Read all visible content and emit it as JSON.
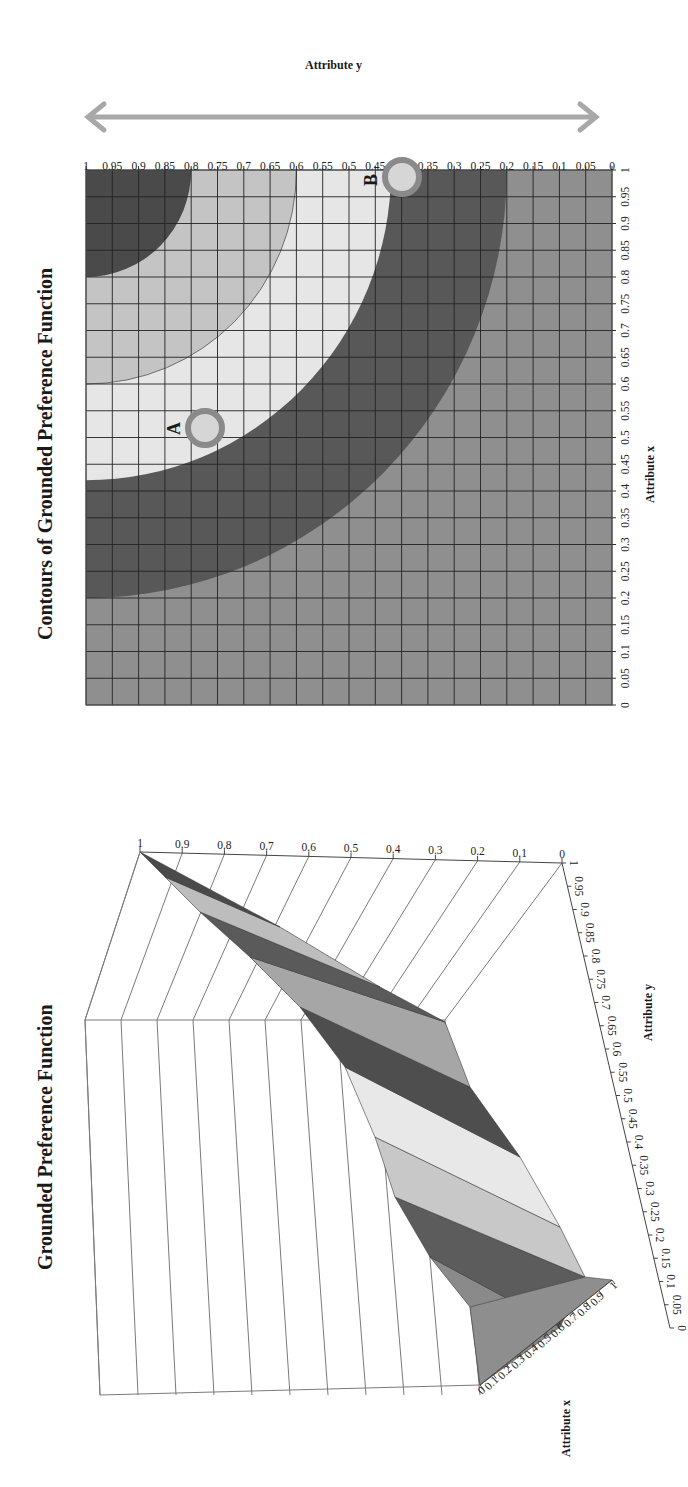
{
  "chart_data": [
    {
      "type": "surface3d",
      "title": "Grounded Preference Function",
      "xlabel": "Attribute x",
      "ylabel": "Attribute y",
      "zlabel": "",
      "x_ticks": [
        "0",
        "0.1",
        "0.2",
        "0.3",
        "0.4",
        "0.5",
        "0.6",
        "0.7",
        "0.8",
        "0.9",
        "1"
      ],
      "y_ticks": [
        "0",
        "0.05",
        "0.1",
        "0.15",
        "0.2",
        "0.25",
        "0.3",
        "0.35",
        "0.4",
        "0.45",
        "0.5",
        "0.55",
        "0.6",
        "0.65",
        "0.7",
        "0.75",
        "0.8",
        "0.85",
        "0.9",
        "0.95",
        "1"
      ],
      "z_ticks": [
        "0",
        "0.1",
        "0.2",
        "0.3",
        "0.4",
        "0.5",
        "0.6",
        "0.7",
        "0.8",
        "0.9",
        "1"
      ],
      "zlim": [
        0,
        1
      ],
      "xlim": [
        0,
        1
      ],
      "ylim": [
        0,
        1
      ],
      "description": "Surface is 0 at x=0,y=0 and rises to 1 at x=1,y=1, with banded shading by value level"
    },
    {
      "type": "contour",
      "title": "Contours of Grounded Preference Function",
      "xlabel": "Attribute x",
      "ylabel": "Attribute y",
      "x_ticks": [
        "0",
        "0.05",
        "0.1",
        "0.15",
        "0.2",
        "0.25",
        "0.3",
        "0.35",
        "0.4",
        "0.45",
        "0.5",
        "0.55",
        "0.6",
        "0.65",
        "0.7",
        "0.75",
        "0.8",
        "0.85",
        "0.9",
        "0.95",
        "1"
      ],
      "y_ticks": [
        "0",
        "0.05",
        "0.1",
        "0.15",
        "0.2",
        "0.25",
        "0.3",
        "0.35",
        "0.4",
        "0.45",
        "0.5",
        "0.55",
        "0.6",
        "0.65",
        "0.7",
        "0.75",
        "0.8",
        "0.85",
        "0.9",
        "0.95",
        "1"
      ],
      "xlim": [
        0,
        1
      ],
      "ylim": [
        0,
        1
      ],
      "grid": true,
      "contour_boundaries": [
        {
          "level_band": "outermost boundary",
          "passes_through": [
            [
              1,
              0.2
            ],
            [
              0.2,
              1
            ]
          ]
        },
        {
          "level_band": "dark band inner boundary",
          "passes_through": [
            [
              1,
              0.43
            ],
            [
              0.4,
              1
            ]
          ]
        },
        {
          "level_band": "thin line",
          "passes_through": [
            [
              1,
              0.6
            ],
            [
              0.6,
              1
            ]
          ]
        },
        {
          "level_band": "top-right dark region",
          "passes_through": [
            [
              1,
              0.8
            ],
            [
              0.8,
              1
            ]
          ]
        }
      ],
      "annotations": [
        {
          "label": "A",
          "x": 0.52,
          "y": 0.77
        },
        {
          "label": "B",
          "x": 0.98,
          "y": 0.4
        }
      ],
      "arrow": {
        "orientation": "vertical double-headed",
        "axis": "Attribute y"
      }
    }
  ],
  "charts": {
    "surface": {
      "title": "Grounded Preference Function",
      "xlabel": "Attribute x",
      "ylabel": "Attribute y"
    },
    "contour": {
      "title": "Contours of Grounded Preference Function",
      "xlabel": "Attribute x",
      "ylabel": "Attribute y",
      "point_a": "A",
      "point_b": "B"
    }
  },
  "colors": {
    "band_outer": "#8f8f8f",
    "band_dark": "#585858",
    "band_light": "#e6e6e6",
    "band_mid_light": "#c4c4c4",
    "band_top_dark": "#4a4a4a",
    "marker_ring": "#8a8a8a",
    "marker_fill": "#d6d6d6",
    "arrow": "#a8a8a8",
    "grid": "#222222"
  }
}
